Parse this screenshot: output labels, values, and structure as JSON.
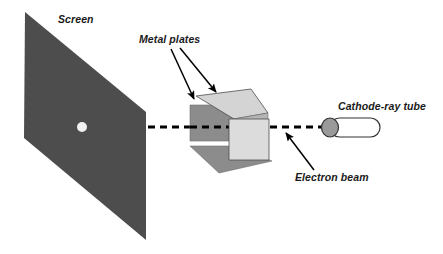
{
  "figure": {
    "background_color": "#ffffff",
    "width": 443,
    "height": 254
  },
  "labels": {
    "screen": "Screen",
    "metal_plates": "Metal plates",
    "cathode_ray_tube": "Cathode-ray tube",
    "electron_beam": "Electron beam"
  },
  "colors": {
    "screen_fill": "#4d4d4d",
    "screen_spot": "#f2f2f2",
    "plate_dark": "#8c8c8c",
    "plate_mid": "#a6a6a6",
    "plate_light": "#d4d4d4",
    "plate_lighter": "#dcdcdc",
    "tube_body": "#ffffff",
    "tube_cap": "#9a9a9a",
    "outline": "#333333",
    "beam_line": "#000000",
    "arrow": "#000000",
    "text": "#1a1a1a"
  },
  "geometry": {
    "screen_polygon": "25,12 146,112 146,240 24,138",
    "screen_spot": {
      "cx": 82,
      "cy": 127,
      "r": 5
    },
    "beam_line": {
      "x1": 148,
      "y1": 127,
      "x2": 330,
      "y2": 127,
      "dash": "7 5",
      "width": 3.2
    },
    "tube": {
      "x": 322,
      "y": 118,
      "width": 58,
      "height": 19,
      "radius": 9.5
    },
    "tube_cap": {
      "cx": 330,
      "cy": 127.5,
      "r": 8
    },
    "plates": {
      "upper_front": "190,105 234,105 234,137 190,137",
      "upper_top": "196,97 250,90 266,113 234,119",
      "upper_side": "234,105 266,113 266,137 234,137",
      "lower_front": "228,120 268,120 268,160 228,160",
      "lower_bottom": "190,146 228,146 268,160 216,172",
      "lower_side": "268,120 268,160 258,166 258,126"
    },
    "arrows": {
      "metal_plates_left": {
        "x1": 172,
        "y1": 50,
        "x2": 195,
        "y2": 100
      },
      "metal_plates_right": {
        "x1": 180,
        "y1": 48,
        "x2": 217,
        "y2": 93
      },
      "electron_beam": {
        "x1": 313,
        "y1": 170,
        "x2": 285,
        "y2": 133
      }
    },
    "label_positions": {
      "screen": {
        "x": 58,
        "y": 23
      },
      "metal_plates": {
        "x": 139,
        "y": 43
      },
      "cathode_ray_tube": {
        "x": 340,
        "y": 110
      },
      "electron_beam": {
        "x": 296,
        "y": 180
      }
    }
  }
}
